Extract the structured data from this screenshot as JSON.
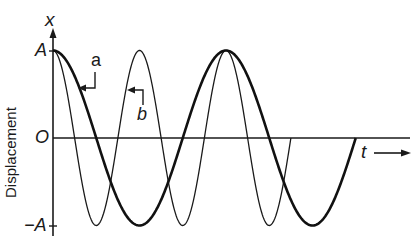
{
  "chart_data": {
    "type": "line",
    "title": "",
    "xlabel": "t",
    "ylabel": "Displacement",
    "y_axis_symbol": "x",
    "y_ticks": [
      "A",
      "O",
      "-A"
    ],
    "y_tick_values": [
      1,
      0,
      -1
    ],
    "grid": false,
    "legend": "curve labels a and b with pointer arrows",
    "series": [
      {
        "name": "a",
        "function": "x = A cos(ωt)",
        "relative_frequency": 1,
        "periods_shown": 1.75,
        "stroke": "thick",
        "color": "#111111"
      },
      {
        "name": "b",
        "function": "x = A cos(2ωt)",
        "relative_frequency": 2,
        "periods_shown": 2.75,
        "stroke": "thin",
        "color": "#111111"
      }
    ],
    "annotations": [
      {
        "text": "a",
        "points_to": "curve a"
      },
      {
        "text": "b",
        "points_to": "curve b"
      }
    ]
  },
  "labels": {
    "y_symbol": "x",
    "y_amp_pos": "A",
    "origin": "O",
    "y_amp_neg": "−A",
    "x_symbol": "t",
    "ylabel": "Displacement",
    "curve_a": "a",
    "curve_b": "b"
  }
}
